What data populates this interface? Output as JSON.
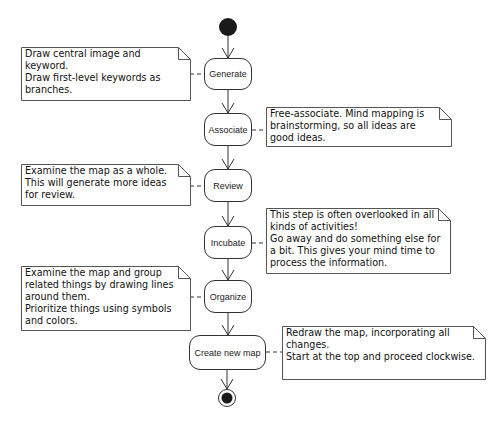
{
  "diagram": {
    "type": "UML activity diagram",
    "colors": {
      "stroke": "#333333",
      "fill": "#ffffff",
      "text": "#111111",
      "start_node": "#1a1a1a"
    },
    "start": {
      "label": ""
    },
    "end": {
      "label": ""
    },
    "steps": [
      {
        "label": "Generate",
        "note": [
          "Draw central image and",
          "keyword.",
          "Draw first-level keywords as",
          "branches."
        ]
      },
      {
        "label": "Associate",
        "note": [
          "Free-associate. Mind mapping is",
          "brainstorming, so all ideas are",
          "good ideas."
        ]
      },
      {
        "label": "Review",
        "note": [
          "Examine the map as a whole.",
          "This will generate more ideas",
          "for review."
        ]
      },
      {
        "label": "Incubate",
        "note": [
          "This step is often overlooked in all",
          "kinds of activities!",
          "Go away and do something else for",
          "a bit. This gives your mind time to",
          "process the information."
        ]
      },
      {
        "label": "Organize",
        "note": [
          "Examine the map and group",
          "related things by drawing lines",
          "around them.",
          "Prioritize things using symbols",
          "and colors."
        ]
      },
      {
        "label": "Create new map",
        "note": [
          "Redraw the map, incorporating all",
          "changes.",
          "Start at the top and proceed clockwise."
        ]
      }
    ]
  }
}
